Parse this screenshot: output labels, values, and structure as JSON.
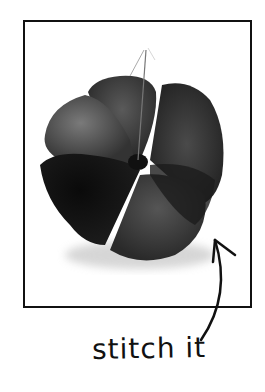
{
  "caption": "stitch it",
  "colors": {
    "frame": "#111111",
    "fabric_dark": "#1a1a1a",
    "fabric_mid": "#3a3a3a",
    "fabric_light": "#6a6a6a",
    "background": "#ffffff"
  },
  "illustration": {
    "subject": "fabric-flower",
    "annotation_arrow": "curved-arrow-pointing-to-flower"
  }
}
